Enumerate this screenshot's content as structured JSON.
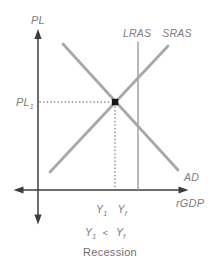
{
  "diagram": {
    "caption": "Recession",
    "axes": {
      "y_label": "PL",
      "x_label": "rGDP"
    },
    "curves": {
      "lras_label": "LRAS",
      "sras_label": "SRAS",
      "ad_label": "AD"
    },
    "equilibrium": {
      "price_label": {
        "main": "PL",
        "sub": "1"
      },
      "output_y1": {
        "main": "Y",
        "sub": "1"
      },
      "output_yf": {
        "main": "Y",
        "sub": "f"
      },
      "inequality": {
        "lhs_main": "Y",
        "lhs_sub": "1",
        "operator": "<",
        "rhs_main": "Y",
        "rhs_sub": "f"
      }
    },
    "colors": {
      "axis": "#3d3d3d",
      "curve": "#a8a8a8",
      "lras": "#9b9b9b",
      "guide": "#4a4a4a",
      "point": "#161616",
      "label": "#7d7d7d",
      "caption": "#6f6f6f"
    }
  }
}
